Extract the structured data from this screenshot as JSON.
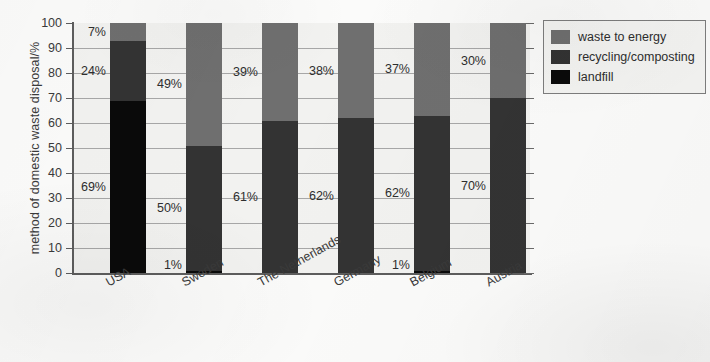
{
  "chart_data": {
    "type": "bar",
    "subtype": "stacked-bar-100",
    "title": "",
    "xlabel": "",
    "ylabel": "method of domestic waste disposal/%",
    "ylim": [
      0,
      100
    ],
    "yticks": [
      0,
      10,
      20,
      30,
      40,
      50,
      60,
      70,
      80,
      90,
      100
    ],
    "grid": true,
    "legend_position": "top-right",
    "categories": [
      "USA",
      "Sweden",
      "The Netherlands",
      "Germany",
      "Belgium",
      "Austria"
    ],
    "series": [
      {
        "name": "waste to energy",
        "color": "#6f6f6f",
        "values": [
          7,
          49,
          39,
          38,
          37,
          30
        ],
        "labels": [
          "7%",
          "49%",
          "39%",
          "38%",
          "37%",
          "30%"
        ]
      },
      {
        "name": "recycling/composting",
        "color": "#333333",
        "values": [
          24,
          50,
          61,
          62,
          62,
          70
        ],
        "labels": [
          "24%",
          "50%",
          "61%",
          "62%",
          "62%",
          "70%"
        ]
      },
      {
        "name": "landfill",
        "color": "#0a0a0a",
        "values": [
          69,
          1,
          0,
          0,
          1,
          0
        ],
        "labels": [
          "69%",
          "1%",
          "",
          "",
          "1%",
          ""
        ]
      }
    ]
  },
  "axes": {
    "y_title": "method of domestic waste disposal/%",
    "y_tick_labels": [
      "100",
      "90",
      "80",
      "70",
      "60",
      "50",
      "40",
      "30",
      "20",
      "10",
      "0"
    ],
    "x_tick_labels": [
      "USA",
      "Sweden",
      "The Netherlands",
      "Germany",
      "Belgium",
      "Austria"
    ]
  },
  "legend": {
    "items": [
      {
        "label": "waste to energy",
        "color": "#6f6f6f"
      },
      {
        "label": "recycling/composting",
        "color": "#333333"
      },
      {
        "label": "landfill",
        "color": "#0a0a0a"
      }
    ]
  }
}
